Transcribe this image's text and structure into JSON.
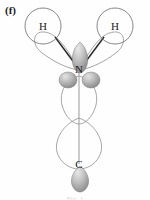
{
  "figure": {
    "panel_label": "(f)",
    "caption_partial": "Fig. 1",
    "background_color": "#fefefe"
  },
  "colors": {
    "outline_stroke": "#8f8f8f",
    "filled_lobe_light": "#d6d6d6",
    "filled_lobe_mid": "#a9a9a9",
    "filled_lobe_dark": "#8a8a8a",
    "bond_dark": "#2b2b2b",
    "bond_light": "#9a9a9a",
    "circle_stroke": "#7a7a7a",
    "text_color": "#202020"
  },
  "atoms": [
    {
      "id": "h-left",
      "label": "H",
      "x": 43,
      "y": 26,
      "circle_radius": 18,
      "has_circle": true
    },
    {
      "id": "h-right",
      "label": "H",
      "x": 115,
      "y": 26,
      "circle_radius": 18,
      "has_circle": true
    },
    {
      "id": "n-center",
      "label": "N",
      "x": 79,
      "y": 70,
      "circle_radius": 0,
      "has_circle": false
    },
    {
      "id": "c-bottom",
      "label": "C",
      "x": 79,
      "y": 165,
      "circle_radius": 0,
      "has_circle": false
    }
  ],
  "bonds": [
    {
      "id": "bond-h-left-n",
      "from": "h-left",
      "to": "n-center",
      "style": "dark-solid",
      "x1": 56,
      "y1": 38,
      "x2": 80,
      "y2": 70
    },
    {
      "id": "bond-h-right-n",
      "from": "h-right",
      "to": "n-center",
      "style": "dark-solid",
      "x1": 103,
      "y1": 38,
      "x2": 79,
      "y2": 70
    },
    {
      "id": "bond-n-c",
      "from": "n-center",
      "to": "c-bottom",
      "style": "light-solid",
      "x1": 79,
      "y1": 60,
      "x2": 79,
      "y2": 163
    }
  ],
  "orbitals": {
    "outlined": [
      {
        "id": "sp2-lobe-upper-left",
        "description": "large outlined hybrid lobe pointing up-left from N",
        "angle_deg": -50
      },
      {
        "id": "sp2-lobe-upper-right",
        "description": "large outlined hybrid lobe pointing up-right from N",
        "angle_deg": 50
      },
      {
        "id": "sp2-lobe-lower-small",
        "description": "outlined lobe below N along vertical axis",
        "angle_deg": 180
      },
      {
        "id": "p-lobe-lower-large",
        "description": "large outlined lobe extending down toward C",
        "angle_deg": 180
      }
    ],
    "filled": [
      {
        "id": "p-lobe-n-up",
        "description": "shaded lobe above N pointing up",
        "cx": 80,
        "cy": 55,
        "rx": 8,
        "ry": 13
      },
      {
        "id": "p-lobe-n-down-left",
        "description": "shaded lobe below-left of N",
        "cx": 68,
        "cy": 80,
        "rx": 9,
        "ry": 8
      },
      {
        "id": "p-lobe-n-down-right",
        "description": "shaded lobe below-right of N",
        "cx": 91,
        "cy": 80,
        "rx": 9,
        "ry": 8
      },
      {
        "id": "p-lobe-c-down",
        "description": "shaded lobe below C pointing down",
        "cx": 80,
        "cy": 178,
        "rx": 9,
        "ry": 12
      }
    ]
  }
}
